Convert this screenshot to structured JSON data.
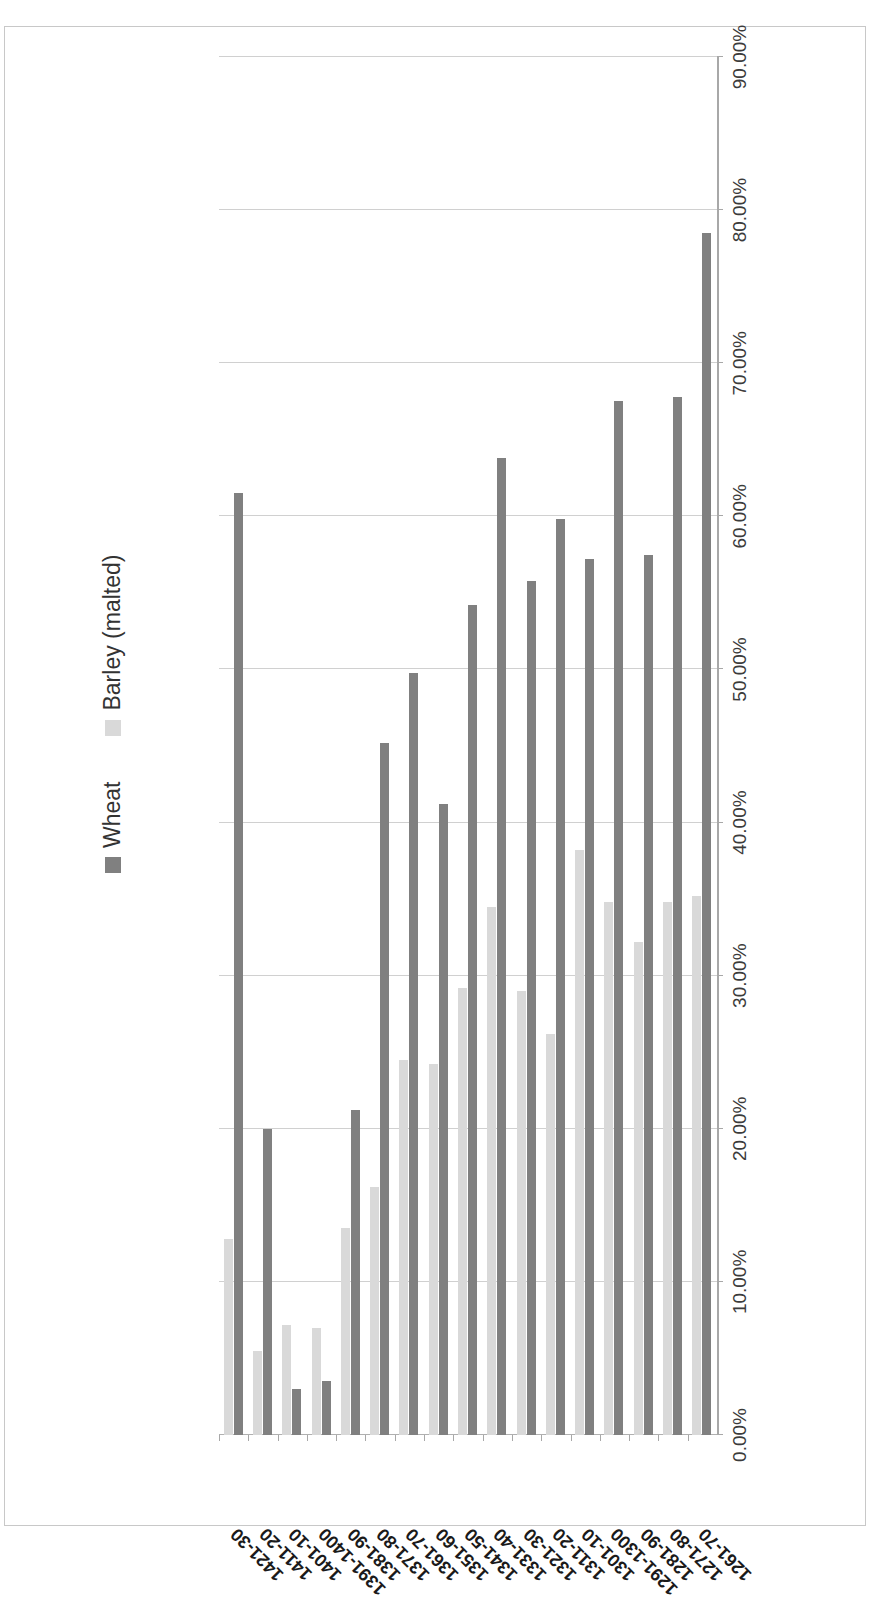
{
  "chart_data": {
    "type": "bar",
    "orientation": "horizontal",
    "title": "",
    "subtitle": "",
    "xlabel": "",
    "ylabel": "",
    "xlim": [
      0,
      90
    ],
    "grid": true,
    "legend_position": "top-right",
    "tick_suffix": "%",
    "tick_labels": [
      "0.00%",
      "10.00%",
      "20.00%",
      "30.00%",
      "40.00%",
      "50.00%",
      "60.00%",
      "70.00%",
      "80.00%",
      "90.00%"
    ],
    "tick_values": [
      0,
      10,
      20,
      30,
      40,
      50,
      60,
      70,
      80,
      90
    ],
    "categories": [
      "1261-70",
      "1271-80",
      "1281-90",
      "1291-1300",
      "1301-10",
      "1311-20",
      "1321-30",
      "1331-40",
      "1341-50",
      "1351-60",
      "1361-70",
      "1371-80",
      "1381-90",
      "1391-1400",
      "1401-10",
      "1411-20",
      "1421-30"
    ],
    "series": [
      {
        "name": "Wheat",
        "color": "#808080",
        "values": [
          78.5,
          67.8,
          57.5,
          67.5,
          57.2,
          59.8,
          55.8,
          63.8,
          54.2,
          41.2,
          49.8,
          45.2,
          21.2,
          3.5,
          3.0,
          20.0,
          61.5
        ]
      },
      {
        "name": "Barley (malted)",
        "color": "#d9d9d9",
        "values": [
          35.2,
          34.8,
          32.2,
          34.8,
          38.2,
          26.2,
          29.0,
          34.5,
          29.2,
          24.2,
          24.5,
          16.2,
          13.5,
          7.0,
          7.2,
          5.5,
          12.8
        ]
      }
    ]
  },
  "legend": {
    "items": [
      {
        "label": "Wheat",
        "color": "#808080"
      },
      {
        "label": "Barley (malted)",
        "color": "#d9d9d9"
      }
    ]
  },
  "colors": {
    "wheat": "#808080",
    "barley": "#d9d9d9",
    "gridline": "#d0d0d0",
    "axis": "#a8a8a8",
    "frame": "#c8c8c8",
    "text": "#333333"
  }
}
